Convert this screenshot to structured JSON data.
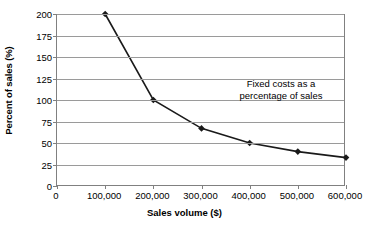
{
  "chart_data": {
    "type": "line",
    "title": "",
    "xlabel": "Sales volume ($)",
    "ylabel": "Percent of sales (%)",
    "x": [
      100000,
      200000,
      300000,
      400000,
      500000,
      600000
    ],
    "values": [
      200,
      100,
      67,
      50,
      40,
      33
    ],
    "series": [
      {
        "name": "Fixed costs as a percentage of sales",
        "x": [
          100000,
          200000,
          300000,
          400000,
          500000,
          600000
        ],
        "values": [
          200,
          100,
          67,
          50,
          40,
          33
        ]
      }
    ],
    "xlim": [
      0,
      600000
    ],
    "ylim": [
      0,
      200
    ],
    "xticks": [
      0,
      100000,
      200000,
      300000,
      400000,
      500000,
      600000
    ],
    "xtick_labels": [
      "0",
      "100,000",
      "200,000",
      "300,000",
      "400,000",
      "500,000",
      "600,000"
    ],
    "yticks": [
      0,
      25,
      50,
      75,
      100,
      125,
      150,
      175,
      200
    ],
    "ytick_labels": [
      "0",
      "25",
      "50",
      "75",
      "100",
      "125",
      "150",
      "175",
      "200"
    ],
    "grid": "horizontal",
    "legend": "none",
    "annotations": [
      {
        "text_lines": [
          "Fixed costs as a",
          "percentage of sales"
        ],
        "x": 430000,
        "y": 112
      }
    ],
    "colors": {
      "line": "#1a1a1a",
      "marker": "#1a1a1a",
      "grid": "#9a9a9a",
      "axis": "#808080",
      "background": "#ffffff",
      "text": "#000000"
    },
    "marker": "diamond"
  }
}
